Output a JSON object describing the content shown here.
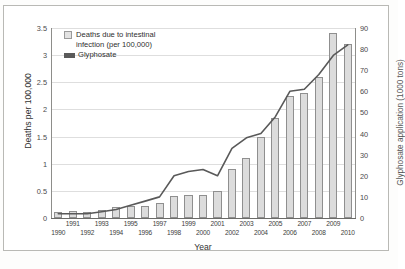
{
  "chart_data": {
    "type": "bar",
    "title": "",
    "xlabel": "Year",
    "ylabel": "Deaths per 100,000",
    "y2label": "Glyphosate application (1000 tons)",
    "grid": true,
    "legend_position": "top-left",
    "ylim": [
      0,
      3.5
    ],
    "y2lim": [
      0,
      90
    ],
    "yticks": [
      "0",
      "0.5",
      "1",
      "1.5",
      "2",
      "2.5",
      "3",
      "3.5"
    ],
    "y2ticks": [
      "0",
      "10",
      "20",
      "30",
      "40",
      "50",
      "60",
      "70",
      "80",
      "90"
    ],
    "categories": [
      "1990",
      "1991",
      "1992",
      "1993",
      "1994",
      "1995",
      "1996",
      "1997",
      "1998",
      "1999",
      "2000",
      "2001",
      "2002",
      "2003",
      "2004",
      "2005",
      "2006",
      "2007",
      "2008",
      "2009",
      "2010"
    ],
    "series": [
      {
        "name": "Deaths due to intestinal infection (per 100,000)",
        "kind": "bar",
        "axis": "left",
        "color": "#dcdcdc",
        "edge": "#8f8f8f",
        "values": [
          0.12,
          0.13,
          0.12,
          0.14,
          0.2,
          0.22,
          0.23,
          0.28,
          0.4,
          0.42,
          0.42,
          0.5,
          0.9,
          1.1,
          1.5,
          1.85,
          2.25,
          2.3,
          2.6,
          3.4,
          3.2
        ]
      },
      {
        "name": "Glyphosate",
        "kind": "line",
        "axis": "right",
        "color": "#595959",
        "values": [
          2,
          2,
          2,
          3,
          4,
          6,
          8,
          10,
          20,
          22,
          23,
          20,
          33,
          38,
          40,
          48,
          60,
          61,
          68,
          77,
          82
        ]
      }
    ]
  },
  "legend": {
    "items": [
      {
        "label_line1": "Deaths due to intestinal",
        "label_line2": "infection (per 100,000)",
        "swatch": "bar-swatch"
      },
      {
        "label_line1": "Glyphosate",
        "label_line2": "",
        "swatch": "line-swatch"
      }
    ]
  },
  "footer": {
    "smudge": ""
  }
}
